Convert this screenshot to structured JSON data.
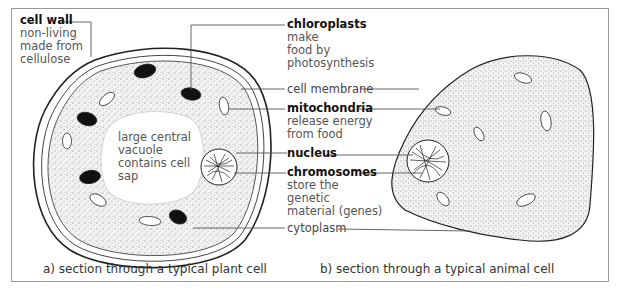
{
  "labels": {
    "cell_wall": {
      "title": "cell wall",
      "desc_lines": [
        "non-living",
        "made from",
        "cellulose"
      ]
    },
    "chloroplasts": {
      "title": "chloroplasts",
      "desc_lines": [
        "make",
        "food by",
        "photosynthesis"
      ]
    },
    "cell_membrane": {
      "title": "cell membrane"
    },
    "mitochondria": {
      "title": "mitochondria",
      "desc_lines": [
        "release energy",
        "from food"
      ]
    },
    "nucleus": {
      "title": "nucleus"
    },
    "chromosomes": {
      "title": "chromosomes",
      "desc_lines": [
        "store the",
        "genetic",
        "material (genes)"
      ]
    },
    "cytoplasm": {
      "title": "cytoplasm"
    },
    "vacuole": {
      "lines": [
        "large central",
        "vacuole",
        "contains cell",
        "sap"
      ]
    }
  },
  "captions": {
    "plant": "a)  section through a typical plant cell",
    "animal": "b)  section through a typical animal cell"
  },
  "colors": {
    "outline": "#222222",
    "frame": "#9a9a9a",
    "stipple": "#7a7a7a",
    "chloroplast": "#111111"
  }
}
